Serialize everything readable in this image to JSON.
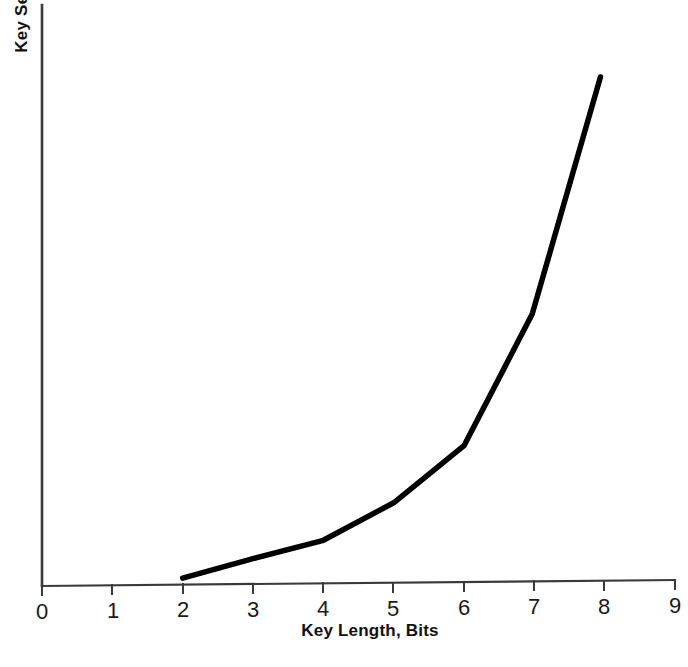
{
  "figure": {
    "background_color": "#ffffff",
    "ink_color": "#000000",
    "axis_color": "#3a3a3a"
  },
  "chart_data": {
    "type": "line",
    "title": "",
    "subtitle": "",
    "xlabel": "Key Length, Bits",
    "ylabel": "Key Security",
    "xlim": [
      0,
      9
    ],
    "ylim": [
      0,
      1
    ],
    "grid": false,
    "legend": null,
    "legend_position": "none",
    "x_tick_labels": [
      "0",
      "1",
      "2",
      "3",
      "4",
      "5",
      "6",
      "7",
      "8",
      "9"
    ],
    "x_ticks": [
      0,
      1,
      2,
      3,
      4,
      5,
      6,
      7,
      8,
      9
    ],
    "y_tick_labels": [],
    "y_ticks": [],
    "annotations": [],
    "series": [
      {
        "name": "Key Security",
        "stroke_color": "#000000",
        "stroke_width": 5.5,
        "x": [
          2.0,
          3.0,
          4.0,
          5.0,
          6.0,
          6.97,
          7.94
        ],
        "y": [
          0.013,
          0.05,
          0.085,
          0.158,
          0.27,
          0.53,
          1.0
        ]
      }
    ]
  },
  "axes": {
    "x_axis_name": "x-axis",
    "y_axis_name": "y-axis"
  }
}
